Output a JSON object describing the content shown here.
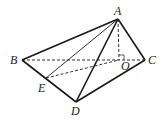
{
  "diagram": {
    "type": "geometry-pyramid",
    "points": {
      "A": {
        "label": "A",
        "x": 118,
        "y": 19
      },
      "B": {
        "label": "B",
        "x": 22,
        "y": 60
      },
      "C": {
        "label": "C",
        "x": 145,
        "y": 60
      },
      "D": {
        "label": "D",
        "x": 76,
        "y": 102
      },
      "E": {
        "label": "E",
        "x": 46,
        "y": 78
      },
      "O": {
        "label": "O",
        "x": 119,
        "y": 60
      }
    },
    "solid_edges": [
      [
        "A",
        "B"
      ],
      [
        "A",
        "C"
      ],
      [
        "A",
        "D"
      ],
      [
        "B",
        "D"
      ],
      [
        "D",
        "C"
      ],
      [
        "A",
        "E"
      ]
    ],
    "dashed_edges": [
      [
        "B",
        "C"
      ],
      [
        "A",
        "O"
      ],
      [
        "E",
        "O"
      ]
    ],
    "right_angle_at": "O",
    "colors": {
      "line": "#1a1a1a",
      "background": "#ffffff"
    }
  }
}
